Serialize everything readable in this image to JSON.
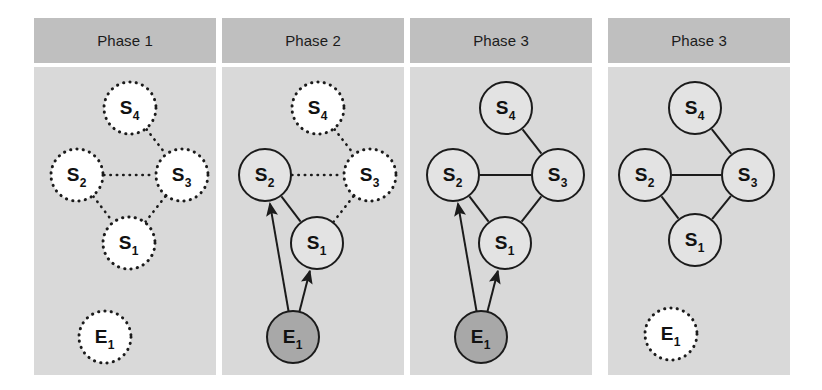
{
  "figure": {
    "width": 822,
    "height": 390,
    "background": "#ffffff",
    "panel_background": "#d9d9d9",
    "header_background": "#bfbfbf",
    "stroke_color": "#1b1b1b",
    "active_node_fill": "#a8a8a8",
    "inactive_node_fill": "#ffffff"
  },
  "panels": [
    {
      "id": "panel-1",
      "title": "Phase 1",
      "x": 34,
      "nodes": [
        {
          "id": "S4",
          "label": "S",
          "sub": "4",
          "cx": 96,
          "cy": 41,
          "r": 26,
          "style": "dashed",
          "fill": "#ffffff"
        },
        {
          "id": "S2",
          "label": "S",
          "sub": "2",
          "cx": 43,
          "cy": 108,
          "r": 26,
          "style": "dashed",
          "fill": "#ffffff"
        },
        {
          "id": "S3",
          "label": "S",
          "sub": "3",
          "cx": 148,
          "cy": 108,
          "r": 26,
          "style": "dashed",
          "fill": "#ffffff"
        },
        {
          "id": "S1",
          "label": "S",
          "sub": "1",
          "cx": 95,
          "cy": 176,
          "r": 26,
          "style": "dashed",
          "fill": "#ffffff"
        },
        {
          "id": "E1",
          "label": "E",
          "sub": "1",
          "cx": 71,
          "cy": 270,
          "r": 26,
          "style": "dashed",
          "fill": "#ffffff"
        }
      ],
      "edges": [
        {
          "from": "S4",
          "to": "S3",
          "style": "dashed"
        },
        {
          "from": "S2",
          "to": "S3",
          "style": "dashed"
        },
        {
          "from": "S2",
          "to": "S1",
          "style": "dashed"
        },
        {
          "from": "S3",
          "to": "S1",
          "style": "dashed"
        }
      ],
      "arrows": []
    },
    {
      "id": "panel-2",
      "title": "Phase 2",
      "x": 222,
      "nodes": [
        {
          "id": "S4",
          "label": "S",
          "sub": "4",
          "cx": 96,
          "cy": 41,
          "r": 26,
          "style": "dashed",
          "fill": "#ffffff"
        },
        {
          "id": "S2",
          "label": "S",
          "sub": "2",
          "cx": 43,
          "cy": 108,
          "r": 26,
          "style": "solid",
          "fill": "#e3e3e3"
        },
        {
          "id": "S3",
          "label": "S",
          "sub": "3",
          "cx": 148,
          "cy": 108,
          "r": 26,
          "style": "dashed",
          "fill": "#ffffff"
        },
        {
          "id": "S1",
          "label": "S",
          "sub": "1",
          "cx": 95,
          "cy": 176,
          "r": 26,
          "style": "solid",
          "fill": "#e3e3e3"
        },
        {
          "id": "E1",
          "label": "E",
          "sub": "1",
          "cx": 71,
          "cy": 270,
          "r": 26,
          "style": "solid",
          "fill": "#a8a8a8"
        }
      ],
      "edges": [
        {
          "from": "S4",
          "to": "S3",
          "style": "dashed"
        },
        {
          "from": "S2",
          "to": "S3",
          "style": "dashed"
        },
        {
          "from": "S2",
          "to": "S1",
          "style": "solid"
        },
        {
          "from": "S3",
          "to": "S1",
          "style": "dashed"
        }
      ],
      "arrows": [
        {
          "from": "E1",
          "to": "S2"
        },
        {
          "from": "E1",
          "to": "S1"
        }
      ]
    },
    {
      "id": "panel-3",
      "title": "Phase 3",
      "x": 410,
      "nodes": [
        {
          "id": "S4",
          "label": "S",
          "sub": "4",
          "cx": 96,
          "cy": 41,
          "r": 26,
          "style": "solid",
          "fill": "#e3e3e3"
        },
        {
          "id": "S2",
          "label": "S",
          "sub": "2",
          "cx": 43,
          "cy": 108,
          "r": 26,
          "style": "solid",
          "fill": "#e3e3e3"
        },
        {
          "id": "S3",
          "label": "S",
          "sub": "3",
          "cx": 148,
          "cy": 108,
          "r": 26,
          "style": "solid",
          "fill": "#e3e3e3"
        },
        {
          "id": "S1",
          "label": "S",
          "sub": "1",
          "cx": 95,
          "cy": 176,
          "r": 26,
          "style": "solid",
          "fill": "#e3e3e3"
        },
        {
          "id": "E1",
          "label": "E",
          "sub": "1",
          "cx": 71,
          "cy": 270,
          "r": 26,
          "style": "solid",
          "fill": "#a8a8a8"
        }
      ],
      "edges": [
        {
          "from": "S4",
          "to": "S3",
          "style": "solid"
        },
        {
          "from": "S2",
          "to": "S3",
          "style": "solid"
        },
        {
          "from": "S2",
          "to": "S1",
          "style": "solid"
        },
        {
          "from": "S3",
          "to": "S1",
          "style": "solid"
        }
      ],
      "arrows": [
        {
          "from": "E1",
          "to": "S2"
        },
        {
          "from": "E1",
          "to": "S1"
        }
      ]
    },
    {
      "id": "panel-4",
      "title": "Phase 3",
      "x": 608,
      "nodes": [
        {
          "id": "S4",
          "label": "S",
          "sub": "4",
          "cx": 87,
          "cy": 41,
          "r": 26,
          "style": "solid",
          "fill": "#e3e3e3"
        },
        {
          "id": "S2",
          "label": "S",
          "sub": "2",
          "cx": 37,
          "cy": 108,
          "r": 26,
          "style": "solid",
          "fill": "#e3e3e3"
        },
        {
          "id": "S3",
          "label": "S",
          "sub": "3",
          "cx": 140,
          "cy": 108,
          "r": 26,
          "style": "solid",
          "fill": "#e3e3e3"
        },
        {
          "id": "S1",
          "label": "S",
          "sub": "1",
          "cx": 87,
          "cy": 173,
          "r": 26,
          "style": "solid",
          "fill": "#e3e3e3"
        },
        {
          "id": "E1",
          "label": "E",
          "sub": "1",
          "cx": 63,
          "cy": 267,
          "r": 26,
          "style": "dashed",
          "fill": "#ffffff"
        }
      ],
      "edges": [
        {
          "from": "S4",
          "to": "S3",
          "style": "solid"
        },
        {
          "from": "S2",
          "to": "S3",
          "style": "solid"
        },
        {
          "from": "S2",
          "to": "S1",
          "style": "solid"
        },
        {
          "from": "S3",
          "to": "S1",
          "style": "solid"
        }
      ],
      "arrows": []
    }
  ]
}
